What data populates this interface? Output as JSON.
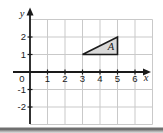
{
  "figure": {
    "background": "#ffffff",
    "bottom_bar_colors": [
      "#ffffff",
      "#6f6f6f",
      "#a6a6a6",
      "#e0e0e0"
    ]
  },
  "chart_data": {
    "type": "scatter",
    "title": "",
    "xlabel": "x",
    "ylabel": "y",
    "xlim": [
      0,
      7
    ],
    "ylim": [
      -3,
      3
    ],
    "x_ticks": [
      1,
      2,
      3,
      4,
      5,
      6
    ],
    "y_ticks": [
      2,
      1,
      -1,
      -2
    ],
    "origin_label": "0",
    "grid": true,
    "legend": false,
    "axis_color": "#1a1a1a",
    "grid_color": "#c9c9c9",
    "shapes": [
      {
        "label": "A",
        "type": "polygon",
        "vertices": [
          [
            3,
            1
          ],
          [
            5,
            1
          ],
          [
            5,
            2
          ]
        ],
        "fill": "#d9d9d9",
        "stroke": "#1a1a1a",
        "label_pos": [
          4.63,
          1.26
        ]
      }
    ]
  }
}
